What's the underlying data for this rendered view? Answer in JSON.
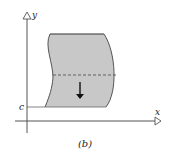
{
  "figure": {
    "caption": "(b)",
    "axes": {
      "x_label": "x",
      "y_label": "y"
    },
    "level_label": "c",
    "region": {
      "fill_color": "#c8c8c8",
      "edge_color": "#555555",
      "dashed_line": true,
      "arrow_direction": "down"
    }
  }
}
